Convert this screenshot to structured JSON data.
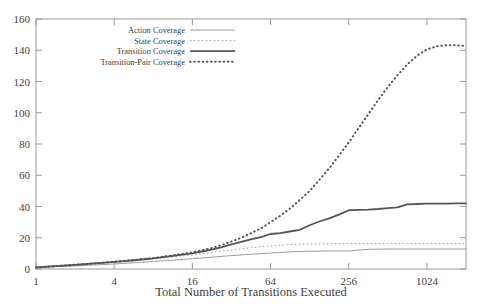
{
  "chart_data": {
    "type": "line",
    "title": "",
    "xlabel": "Total Number of Transitions Executed",
    "ylabel": "",
    "xscale": "log",
    "xlim": [
      1,
      2048
    ],
    "ylim": [
      0,
      160
    ],
    "grid": false,
    "legend_position": "top-center",
    "xticks": [
      1,
      4,
      16,
      64,
      256,
      1024
    ],
    "xtick_labels": [
      "1",
      "4",
      "16",
      "64",
      "256",
      "1024"
    ],
    "yticks": [
      0,
      20,
      40,
      60,
      80,
      100,
      120,
      140,
      160
    ],
    "ytick_labels": [
      "0",
      "20",
      "40",
      "60",
      "80",
      "100",
      "120",
      "140",
      "160"
    ],
    "series": [
      {
        "name": "Action Coverage",
        "style": "thin-solid",
        "color": "#8e8e8e",
        "width": 0.9,
        "x": [
          1,
          1.4,
          2,
          2.8,
          4,
          5.7,
          8,
          11,
          16,
          23,
          32,
          45,
          64,
          90,
          128,
          181,
          256,
          362,
          512,
          724,
          1024,
          1448,
          2048
        ],
        "y": [
          1,
          1.5,
          2,
          2.6,
          3.2,
          4.0,
          4.8,
          5.6,
          6.6,
          7.6,
          8.6,
          9.4,
          10.2,
          11.0,
          11.4,
          11.5,
          11.5,
          12.6,
          12.8,
          12.8,
          12.8,
          12.8,
          12.8
        ]
      },
      {
        "name": "State Coverage",
        "style": "fine-dotted",
        "color": "#aeaeae",
        "width": 1.0,
        "x": [
          1,
          1.4,
          2,
          2.8,
          4,
          5.7,
          8,
          11,
          16,
          23,
          32,
          45,
          64,
          90,
          128,
          181,
          256,
          362,
          512,
          724,
          1024,
          1448,
          2048
        ],
        "y": [
          1,
          1.8,
          2.6,
          3.4,
          4.2,
          5.2,
          6.4,
          7.6,
          9.0,
          10.6,
          12.2,
          13.6,
          14.8,
          15.6,
          16.0,
          16.2,
          16.3,
          16.3,
          16.3,
          16.3,
          16.3,
          16.3,
          16.3
        ]
      },
      {
        "name": "Transition Coverage",
        "style": "thick-solid",
        "color": "#575757",
        "width": 1.8,
        "x": [
          1,
          1.4,
          2,
          2.8,
          4,
          5.7,
          8,
          11,
          16,
          19,
          23,
          27,
          32,
          38,
          45,
          54,
          64,
          76,
          90,
          107,
          128,
          152,
          181,
          215,
          256,
          304,
          362,
          430,
          512,
          608,
          724,
          861,
          1024,
          1218,
          1448,
          1722,
          2048
        ],
        "y": [
          1,
          1.8,
          2.7,
          3.6,
          4.5,
          5.6,
          6.8,
          8.2,
          10.0,
          11.2,
          12.6,
          14.0,
          15.8,
          17.4,
          19.0,
          20.4,
          22.4,
          23.0,
          24.0,
          25.0,
          28.0,
          30.4,
          32.4,
          34.8,
          37.6,
          37.8,
          38.0,
          38.4,
          39.0,
          39.4,
          41.4,
          41.6,
          41.8,
          41.8,
          41.9,
          42.0,
          42.0
        ]
      },
      {
        "name": "Transition-Pair Coverage",
        "style": "bold-dotted",
        "color": "#555555",
        "width": 2.0,
        "x": [
          1,
          1.4,
          2,
          2.8,
          4,
          5.7,
          8,
          11,
          16,
          19,
          23,
          27,
          32,
          38,
          45,
          54,
          64,
          76,
          90,
          107,
          128,
          152,
          181,
          215,
          256,
          304,
          362,
          430,
          512,
          608,
          724,
          861,
          1024,
          1218,
          1448,
          1722,
          2048
        ],
        "y": [
          1,
          1.8,
          2.7,
          3.6,
          4.6,
          5.8,
          7.0,
          8.6,
          10.6,
          12.0,
          13.6,
          15.4,
          17.6,
          20.0,
          22.8,
          26.0,
          30.0,
          34.0,
          38.6,
          44.0,
          50.0,
          57.0,
          64.5,
          72.5,
          81.0,
          90.0,
          99.0,
          108.0,
          116.5,
          124.0,
          131.0,
          136.5,
          140.5,
          142.5,
          143.2,
          143.2,
          142.8
        ]
      }
    ]
  }
}
